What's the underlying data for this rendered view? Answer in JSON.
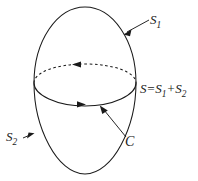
{
  "figure": {
    "background_color": "#ffffff",
    "stroke_color": "#1a1a1a",
    "labels": {
      "s1": {
        "base": "S",
        "sub": "1",
        "full": "S1"
      },
      "s2": {
        "base": "S",
        "sub": "2",
        "full": "S2"
      },
      "c": {
        "text": "C"
      },
      "sum": {
        "full": "S=S1+S2",
        "lhs": "S",
        "equals": "=",
        "term1_base": "S",
        "term1_sub": "1",
        "plus": "+",
        "term2_base": "S",
        "term2_sub": "2"
      }
    },
    "geometry": {
      "outer_ellipse": {
        "description": "egg-shaped closed outline",
        "center_x": 85,
        "center_y": 90,
        "rx": 51,
        "ry": 83
      },
      "equator_ellipse": {
        "description": "horizontal boundary curve C",
        "center_x": 85,
        "center_y": 92,
        "rx": 51,
        "ry": 14,
        "back_arc_style": "dashed",
        "front_arc_style": "solid"
      },
      "arrows": {
        "back_arc_direction": "left",
        "front_arc_direction": "right",
        "leader_s1_target": [
          124,
          34
        ],
        "leader_s2_target": [
          32,
          135
        ],
        "leader_c_target": [
          100,
          106
        ]
      }
    }
  }
}
